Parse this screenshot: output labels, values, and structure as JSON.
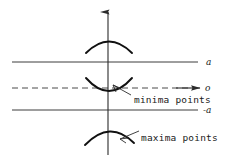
{
  "figure": {
    "background_color": "#ffffff",
    "ink_color": "#111111",
    "width": 232,
    "height": 157
  },
  "axes": {
    "vertical": {
      "name": "vertical-axis",
      "arrow": "up-arrow",
      "x": 108,
      "y_top": 12,
      "y_bottom": 155
    },
    "horizontal": {
      "name": "horizontal-axis",
      "label": "o",
      "arrow": "right-arrow",
      "y": 88,
      "x_start": 12,
      "x_end": 200,
      "style": "dashed"
    }
  },
  "levels": [
    {
      "label": "a",
      "value": 1,
      "y": 62,
      "style": "solid",
      "x_start": 12,
      "x_end": 198
    },
    {
      "label": "o",
      "value": 0,
      "y": 88,
      "style": "dashed",
      "x_start": 12,
      "x_end": 200
    },
    {
      "label": "-a",
      "value": -1,
      "y": 110,
      "style": "solid",
      "x_start": 12,
      "x_end": 198
    }
  ],
  "curves": [
    {
      "name": "upper-arc",
      "kind": "concave-down",
      "x_left": 86,
      "x_right": 132,
      "apex_x": 109,
      "apex_y": 38,
      "edge_y": 53
    },
    {
      "name": "minima-arc",
      "kind": "concave-up",
      "x_left": 86,
      "x_right": 132,
      "apex_x": 109,
      "apex_y": 96,
      "edge_y": 78
    },
    {
      "name": "maxima-arc",
      "kind": "concave-down",
      "x_left": 85,
      "x_right": 134,
      "apex_x": 109,
      "apex_y": 128,
      "edge_y": 145
    }
  ],
  "annotations": [
    {
      "name": "minima-annotation",
      "text": "minima points",
      "text_x": 134,
      "text_y": 102,
      "leader_from_x": 132,
      "leader_from_y": 96,
      "leader_to_x": 113,
      "leader_to_y": 85
    },
    {
      "name": "maxima-annotation",
      "text": "maxima points",
      "text_x": 140,
      "text_y": 140,
      "leader_from_x": 138,
      "leader_from_y": 131,
      "leader_to_x": 119,
      "leader_to_y": 139
    }
  ],
  "labels": {
    "level_a": "a",
    "level_o": "o",
    "level_neg_a": "-a",
    "minima": "minima points",
    "maxima": "maxima points"
  }
}
